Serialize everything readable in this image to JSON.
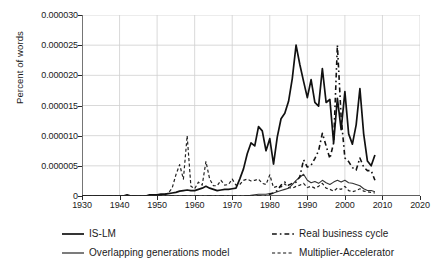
{
  "chart_data": {
    "type": "line",
    "title": "",
    "xlabel": "",
    "ylabel": "Percent of words",
    "xlim": [
      1930,
      2020
    ],
    "ylim": [
      0,
      3e-05
    ],
    "grid": true,
    "legend_position": "bottom",
    "xticks": [
      "1930",
      "1940",
      "1950",
      "1960",
      "1970",
      "1980",
      "1990",
      "2000",
      "2010",
      "2020"
    ],
    "xtick_values": [
      1930,
      1940,
      1950,
      1960,
      1970,
      1980,
      1990,
      2000,
      2010,
      2020
    ],
    "yticks": [
      "0",
      "0.000005",
      "0.000010",
      "0.000015",
      "0.000020",
      "0.000025",
      "0.000030"
    ],
    "ytick_values": [
      0,
      5e-06,
      1e-05,
      1.5e-05,
      2e-05,
      2.5e-05,
      3e-05
    ],
    "x": [
      1930,
      1931,
      1932,
      1933,
      1934,
      1935,
      1936,
      1937,
      1938,
      1939,
      1940,
      1941,
      1942,
      1943,
      1944,
      1945,
      1946,
      1947,
      1948,
      1949,
      1950,
      1951,
      1952,
      1953,
      1954,
      1955,
      1956,
      1957,
      1958,
      1959,
      1960,
      1961,
      1962,
      1963,
      1964,
      1965,
      1966,
      1967,
      1968,
      1969,
      1970,
      1971,
      1972,
      1973,
      1974,
      1975,
      1976,
      1977,
      1978,
      1979,
      1980,
      1981,
      1982,
      1983,
      1984,
      1985,
      1986,
      1987,
      1988,
      1989,
      1990,
      1991,
      1992,
      1993,
      1994,
      1995,
      1996,
      1997,
      1998,
      1999,
      2000,
      2001,
      2002,
      2003,
      2004,
      2005,
      2006,
      2007,
      2008
    ],
    "series": [
      {
        "name": "IS-LM",
        "style": "solid",
        "width": 1.7,
        "color": "#111111",
        "values": [
          0,
          0,
          0,
          0,
          0,
          0,
          0,
          0,
          0,
          0,
          0,
          0,
          2e-07,
          0,
          0,
          0,
          0,
          0,
          2e-07,
          2e-07,
          2e-07,
          3e-07,
          3e-07,
          4e-07,
          5e-07,
          6e-07,
          8e-07,
          9e-07,
          1e-06,
          9e-07,
          9e-07,
          1.1e-06,
          1.3e-06,
          1.6e-06,
          1.3e-06,
          1.1e-06,
          9e-07,
          1e-06,
          1.1e-06,
          1.1e-06,
          1.2e-06,
          1.3e-06,
          2.8e-06,
          4.5e-06,
          7e-06,
          8.8e-06,
          8.3e-06,
          1.15e-05,
          1.08e-05,
          7.5e-06,
          9.5e-06,
          5.3e-06,
          9.8e-06,
          1.28e-05,
          1.37e-05,
          1.57e-05,
          1.95e-05,
          2.5e-05,
          2.18e-05,
          1.9e-05,
          1.63e-05,
          1.93e-05,
          1.55e-05,
          1.49e-05,
          2.11e-05,
          1.55e-05,
          1.6e-05,
          8.8e-06,
          1.62e-05,
          1.1e-05,
          1.73e-05,
          1.03e-05,
          8.6e-06,
          1.18e-05,
          1.78e-05,
          1.03e-05,
          5.8e-06,
          5e-06,
          6.8e-06
        ]
      },
      {
        "name": "Real business cycle",
        "style": "dashdot",
        "width": 1.6,
        "color": "#111111",
        "values": [
          0,
          0,
          0,
          0,
          0,
          0,
          0,
          0,
          0,
          0,
          0,
          0,
          0,
          0,
          0,
          0,
          0,
          0,
          0,
          0,
          0,
          0,
          0,
          0,
          0,
          0,
          0,
          0,
          0,
          0,
          0,
          0,
          0,
          0,
          0,
          0,
          0,
          0,
          0,
          0,
          0,
          0,
          0,
          0,
          0,
          0,
          0,
          0,
          0,
          0,
          3e-07,
          5e-07,
          9e-07,
          1.8e-06,
          2.3e-06,
          1.8e-06,
          2.1e-06,
          2.3e-06,
          3.2e-06,
          6e-06,
          4.8e-06,
          5.1e-06,
          6.2e-06,
          7.5e-06,
          1.04e-05,
          8.3e-06,
          6.2e-06,
          8.8e-06,
          2.5e-05,
          1.31e-05,
          6.3e-06,
          5.7e-06,
          4.7e-06,
          4.3e-06,
          6.3e-06,
          4.8e-06,
          4.2e-06,
          4.2e-06,
          2.6e-06
        ]
      },
      {
        "name": "Overlapping generations model",
        "style": "solid",
        "width": 1.1,
        "color": "#333333",
        "values": [
          0,
          0,
          0,
          0,
          0,
          0,
          0,
          0,
          0,
          0,
          0,
          0,
          0,
          0,
          0,
          0,
          0,
          0,
          0,
          0,
          0,
          0,
          0,
          0,
          0,
          0,
          0,
          0,
          0,
          0,
          0,
          0,
          0,
          0,
          0,
          0,
          0,
          0,
          0,
          0,
          0,
          0,
          0,
          0,
          0,
          1e-07,
          2e-07,
          3e-07,
          3e-07,
          3e-07,
          4e-07,
          5e-07,
          7e-07,
          9e-07,
          1.1e-06,
          1.3e-06,
          1.9e-06,
          2.6e-06,
          3.1e-06,
          3.6e-06,
          2.6e-06,
          2.2e-06,
          2.4e-06,
          2.1e-06,
          2.6e-06,
          2.2e-06,
          1.9e-06,
          2.3e-06,
          2.6e-06,
          2.3e-06,
          2.6e-06,
          2.2e-06,
          2.1e-06,
          1.9e-06,
          1.7e-06,
          1.2e-06,
          9e-07,
          9e-07,
          7e-07
        ]
      },
      {
        "name": "Multiplier-Accelerator",
        "style": "dashed",
        "width": 1.2,
        "color": "#222222",
        "values": [
          0,
          0,
          0,
          0,
          0,
          0,
          0,
          0,
          0,
          0,
          0,
          0,
          0,
          0,
          0,
          0,
          0,
          0,
          0,
          0,
          1e-07,
          1e-07,
          2e-07,
          5e-07,
          1.3e-06,
          3.5e-06,
          5.2e-06,
          2.8e-06,
          1e-05,
          1.6e-06,
          1.2e-06,
          2.3e-06,
          1.8e-06,
          5.7e-06,
          2.8e-06,
          1.7e-06,
          1.7e-06,
          2.6e-06,
          1.8e-06,
          1.9e-06,
          2.8e-06,
          1.8e-06,
          1.9e-06,
          2.6e-06,
          2.8e-06,
          2.5e-06,
          2.6e-06,
          2.8e-06,
          2.1e-06,
          1.9e-06,
          3.5e-06,
          1.4e-06,
          1.6e-06,
          1.5e-06,
          2e-06,
          1.4e-06,
          1.3e-06,
          1.6e-06,
          1.8e-06,
          2.1e-06,
          1.4e-06,
          1.6e-06,
          1.3e-06,
          1.6e-06,
          2.1e-06,
          1.3e-06,
          1.1e-06,
          8e-07,
          1.3e-06,
          1.1e-06,
          1.6e-06,
          9e-07,
          7e-07,
          9e-07,
          1.2e-06,
          8e-07,
          7e-07,
          6e-07,
          5e-07
        ]
      }
    ]
  },
  "legend": {
    "items": [
      {
        "label": "IS-LM",
        "style": "solid",
        "width": 1.7
      },
      {
        "label": "Real business cycle",
        "style": "dashdot",
        "width": 1.6
      },
      {
        "label": "Overlapping generations model",
        "style": "solid",
        "width": 1.1
      },
      {
        "label": "Multiplier-Accelerator",
        "style": "dashed",
        "width": 1.2
      }
    ]
  },
  "colors": {
    "axis": "#2a2a2a",
    "grid": "#cfcfcf",
    "text": "#1a1a1a",
    "background": "#ffffff"
  }
}
